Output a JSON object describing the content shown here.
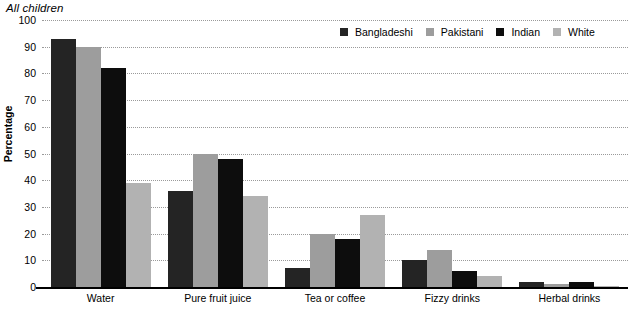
{
  "title": "All children",
  "chart_data": {
    "type": "bar",
    "title": "All children",
    "xlabel": "",
    "ylabel": "Percentage",
    "ylim": [
      0,
      100
    ],
    "ytick_step": 10,
    "yticks": [
      100,
      90,
      80,
      70,
      60,
      50,
      40,
      30,
      20,
      10,
      0
    ],
    "grid": true,
    "legend_position": "top-right",
    "categories": [
      "Water",
      "Pure fruit juice",
      "Tea or coffee",
      "Fizzy drinks",
      "Herbal drinks"
    ],
    "series": [
      {
        "name": "Bangladeshi",
        "color": "#242424",
        "values": [
          93,
          36,
          7,
          10,
          2
        ]
      },
      {
        "name": "Pakistani",
        "color": "#9d9d9d",
        "values": [
          90,
          50,
          20,
          14,
          1
        ]
      },
      {
        "name": "Indian",
        "color": "#0d0d0d",
        "values": [
          82,
          48,
          18,
          6,
          2
        ]
      },
      {
        "name": "White",
        "color": "#b2b2b2",
        "values": [
          39,
          34,
          27,
          4,
          0.5
        ]
      }
    ]
  },
  "legend": {
    "items": [
      {
        "label": "Bangladeshi"
      },
      {
        "label": "Pakistani"
      },
      {
        "label": "Indian"
      },
      {
        "label": "White"
      }
    ]
  }
}
